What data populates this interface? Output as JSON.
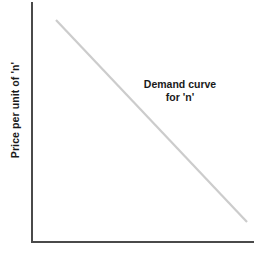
{
  "figure": {
    "background_color": "#ffffff",
    "width": 254,
    "height": 256
  },
  "axes": {
    "color": "#4a4a4a",
    "y_axis_label": "Price per unit of 'n'",
    "x_axis_label": "",
    "origin": {
      "x": 32,
      "y": 242
    },
    "y_axis_top": {
      "x": 32,
      "y": 2
    },
    "x_axis_right": {
      "x": 254,
      "y": 242
    },
    "ticks_visible": false,
    "grid_visible": false
  },
  "annotation": {
    "line1": "Demand curve",
    "line2": "for 'n'",
    "color": "#1a1a1a",
    "center_x": 180,
    "top_y": 78
  },
  "chart_data": {
    "type": "line",
    "title": "",
    "subtitle": "",
    "xlabel": "",
    "ylabel": "Price per unit of 'n'",
    "xlim": [
      0,
      100
    ],
    "ylim": [
      0,
      100
    ],
    "grid": false,
    "legend": "none",
    "annotations": [
      {
        "text": "Demand curve for 'n'",
        "x": 69,
        "y": 75
      }
    ],
    "series": [
      {
        "name": "Demand curve for 'n'",
        "color": "#cccccc",
        "line_width": 2,
        "x": [
          11,
          97
        ],
        "values": [
          92,
          8
        ],
        "points_px": [
          {
            "x": 56,
            "y": 20
          },
          {
            "x": 247,
            "y": 222
          }
        ]
      }
    ],
    "tick_labels": {
      "x": [],
      "y": []
    }
  }
}
